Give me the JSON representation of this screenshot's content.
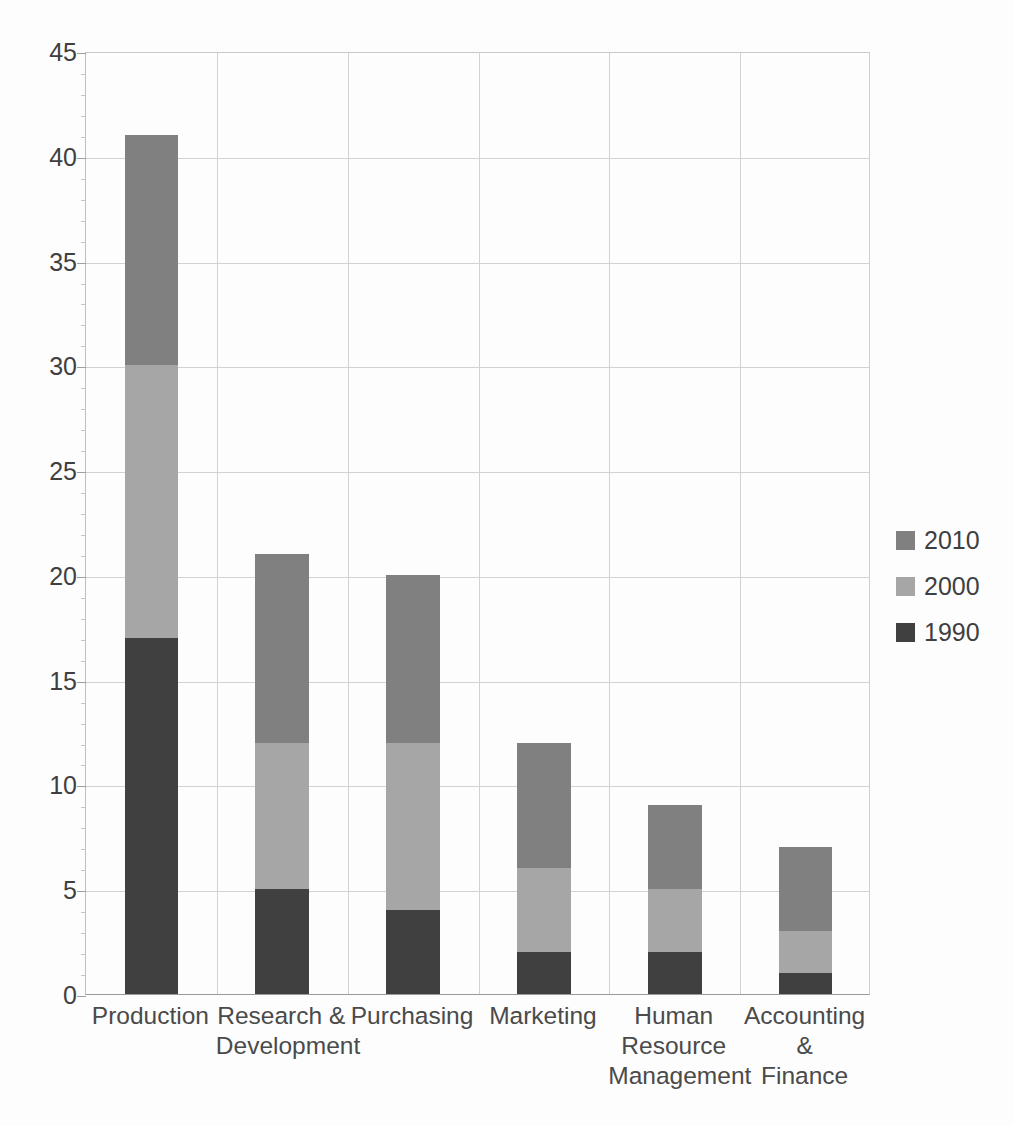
{
  "chart_data": {
    "type": "bar",
    "subtype": "stacked-vertical",
    "title": "",
    "xlabel": "",
    "ylabel": "",
    "ylim": [
      0,
      45
    ],
    "ytick_step": 5,
    "yticks": [
      0,
      5,
      10,
      15,
      20,
      25,
      30,
      35,
      40,
      45
    ],
    "ytick_labels": [
      "0",
      "5",
      "10",
      "15",
      "20",
      "25",
      "30",
      "35",
      "40",
      "45"
    ],
    "minor_tick_step": 1,
    "grid": "both",
    "legend_position": "right",
    "categories": [
      "Production",
      "Research &\nDevelopment",
      "Purchasing",
      "Marketing",
      "Human\nResource\nManagement",
      "Accounting &\nFinance"
    ],
    "series": [
      {
        "name": "1990",
        "color": "#404040",
        "values": [
          17,
          5,
          4,
          2,
          2,
          1
        ]
      },
      {
        "name": "2000",
        "color": "#a6a6a6",
        "values": [
          13,
          7,
          8,
          4,
          3,
          2
        ]
      },
      {
        "name": "2010",
        "color": "#808080",
        "values": [
          11,
          9,
          8,
          6,
          4,
          4
        ]
      }
    ],
    "stack_order_bottom_to_top": [
      "1990",
      "2000",
      "2010"
    ],
    "totals": [
      41,
      21,
      20,
      12,
      9,
      7
    ],
    "legend_entries": [
      {
        "label": "2010",
        "color": "#808080"
      },
      {
        "label": "2000",
        "color": "#a6a6a6"
      },
      {
        "label": "1990",
        "color": "#404040"
      }
    ]
  },
  "axis": {
    "gridline_color": "#d2d2d2",
    "axis_color": "#9a9a9a",
    "text_color": "#3f3f3f"
  },
  "background": "#fdfdfd"
}
